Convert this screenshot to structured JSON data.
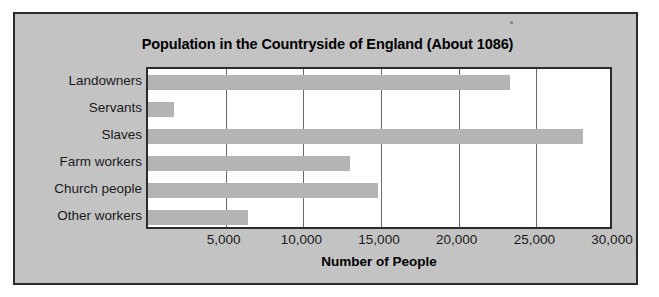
{
  "chart_data": {
    "type": "bar",
    "orientation": "horizontal",
    "title": "Population in the Countryside of England (About 1086)",
    "xlabel": "Number of People",
    "ylabel": "",
    "categories": [
      "Landowners",
      "Servants",
      "Slaves",
      "Farm workers",
      "Church people",
      "Other workers"
    ],
    "values": [
      23300,
      1700,
      28000,
      13000,
      14800,
      6450
    ],
    "xlim": [
      0,
      30000
    ],
    "xticks": [
      5000,
      10000,
      15000,
      20000,
      25000,
      30000
    ],
    "xtick_labels": [
      "5,000",
      "10,000",
      "15,000",
      "20,000",
      "25,000",
      "30,000"
    ],
    "grid": true,
    "legend": false,
    "bar_color": "#b4b4b4",
    "plot_background": "#ffffff",
    "figure_background": "#c3c3c3",
    "axis_color": "#2b2b2b",
    "gridline_color": "#6a6a6a"
  }
}
